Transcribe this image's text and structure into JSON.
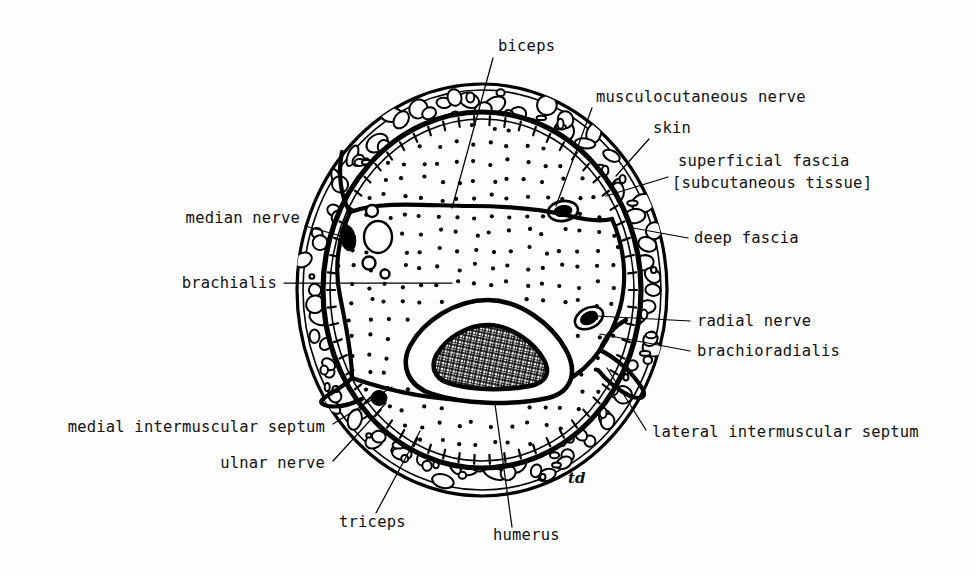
{
  "figure": {
    "signature": "td",
    "background_color": "#fdfdfd",
    "ink_color": "#000000",
    "canvas": {
      "width": 978,
      "height": 577
    }
  },
  "labels": {
    "biceps": "biceps",
    "musculocutaneous_nerve": "musculocutaneous nerve",
    "skin": "skin",
    "superficial_fascia": "superficial fascia",
    "subcutaneous_tissue": "[subcutaneous tissue]",
    "median_nerve": "median nerve",
    "deep_fascia": "deep fascia",
    "brachialis": "brachialis",
    "radial_nerve": "radial nerve",
    "brachioradialis": "brachioradialis",
    "medial_intermuscular_septum": "medial intermuscular septum",
    "lateral_intermuscular_septum": "lateral intermuscular septum",
    "ulnar_nerve": "ulnar nerve",
    "triceps": "triceps",
    "humerus": "humerus"
  },
  "label_positions": {
    "biceps": {
      "x": 498,
      "y": 51,
      "anchor": "start"
    },
    "musculocutaneous_nerve": {
      "x": 596,
      "y": 102,
      "anchor": "start"
    },
    "skin": {
      "x": 653,
      "y": 133,
      "anchor": "start"
    },
    "superficial_fascia": {
      "x": 678,
      "y": 166,
      "anchor": "start"
    },
    "subcutaneous_tissue": {
      "x": 672,
      "y": 188,
      "anchor": "start"
    },
    "median_nerve": {
      "x": 300,
      "y": 223,
      "anchor": "end"
    },
    "deep_fascia": {
      "x": 694,
      "y": 243,
      "anchor": "start"
    },
    "brachialis": {
      "x": 277,
      "y": 288,
      "anchor": "end"
    },
    "radial_nerve": {
      "x": 697,
      "y": 326,
      "anchor": "start"
    },
    "brachioradialis": {
      "x": 697,
      "y": 356,
      "anchor": "start"
    },
    "medial_intermuscular_septum": {
      "x": 325,
      "y": 432,
      "anchor": "end"
    },
    "lateral_intermuscular_septum": {
      "x": 652,
      "y": 437,
      "anchor": "start"
    },
    "ulnar_nerve": {
      "x": 325,
      "y": 468,
      "anchor": "end"
    },
    "triceps": {
      "x": 339,
      "y": 527,
      "anchor": "start"
    },
    "humerus": {
      "x": 493,
      "y": 540,
      "anchor": "start"
    },
    "signature": {
      "x": 568,
      "y": 483
    }
  },
  "structures": {
    "outer_boundary": "skin",
    "layers": [
      "skin",
      "superficial fascia [subcutaneous tissue]",
      "deep fascia",
      "muscle compartments",
      "humerus"
    ],
    "compartments": [
      "biceps",
      "brachialis",
      "triceps",
      "brachioradialis"
    ],
    "nerves": [
      "musculocutaneous nerve",
      "median nerve",
      "radial nerve",
      "ulnar nerve"
    ],
    "septa": [
      "medial intermuscular septum",
      "lateral intermuscular septum"
    ],
    "bone": "humerus"
  }
}
